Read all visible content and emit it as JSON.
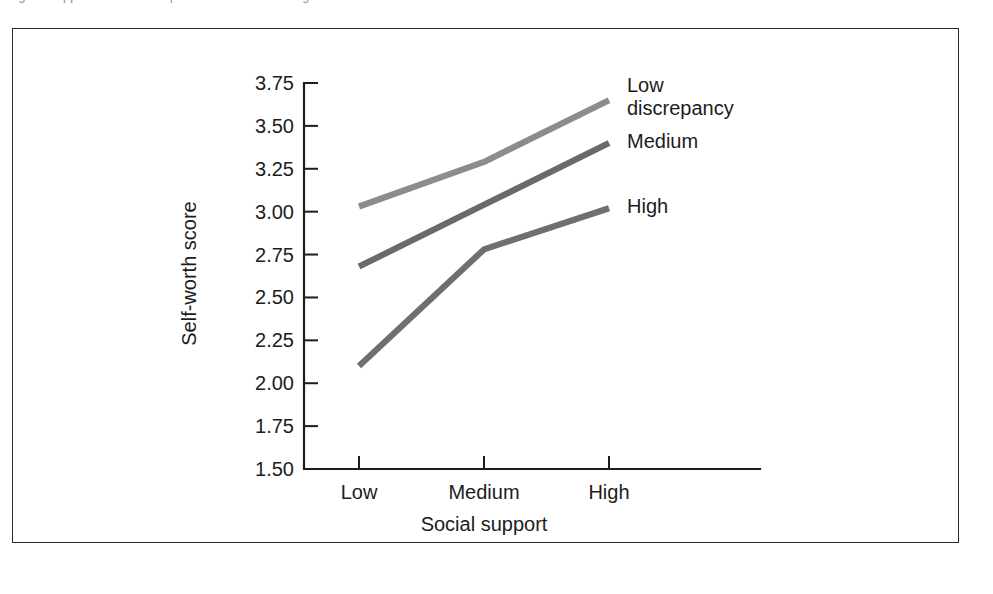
{
  "caption": {
    "text": "Figure  Supportive relationships and self-worth among adolescents"
  },
  "chart_data": {
    "type": "line",
    "title": "",
    "xlabel": "Social support",
    "ylabel": "Self-worth score",
    "categories": [
      "Low",
      "Medium",
      "High"
    ],
    "ylim": [
      1.5,
      3.75
    ],
    "yticks": [
      "1.50",
      "1.75",
      "2.00",
      "2.25",
      "2.50",
      "2.75",
      "3.00",
      "3.25",
      "3.50",
      "3.75"
    ],
    "ytick_values": [
      1.5,
      1.75,
      2.0,
      2.25,
      2.5,
      2.75,
      3.0,
      3.25,
      3.5,
      3.75
    ],
    "grid": false,
    "legend_position": "right-inline",
    "series": [
      {
        "name": "Low discrepancy",
        "label_lines": "Low\ndiscrepancy",
        "color": "#8c8c8c",
        "values": [
          3.03,
          3.29,
          3.65
        ]
      },
      {
        "name": "Medium",
        "label_lines": "Medium",
        "color": "#6a6a6a",
        "values": [
          2.68,
          3.04,
          3.4
        ]
      },
      {
        "name": "High",
        "label_lines": "High",
        "color": "#6f6f6f",
        "values": [
          2.1,
          2.78,
          3.02
        ]
      }
    ]
  },
  "colors": {
    "axis": "#1d1d1d",
    "frame": "#2a2a2a",
    "background": "#ffffff"
  }
}
